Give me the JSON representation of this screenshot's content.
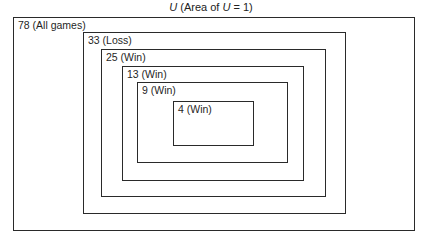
{
  "title": {
    "symbol": "U",
    "prefix": " (Area of ",
    "symbol2": "U",
    "suffix": " = 1)"
  },
  "boxes": [
    {
      "label": "78 (All games)",
      "count": 78,
      "outcome": "All games",
      "left": 13,
      "top": 17,
      "right": 415,
      "bottom": 231
    },
    {
      "label": "33 (Loss)",
      "count": 33,
      "outcome": "Loss",
      "left": 83,
      "top": 32,
      "right": 346,
      "bottom": 214
    },
    {
      "label": "25 (Win)",
      "count": 25,
      "outcome": "Win",
      "left": 101,
      "top": 49,
      "right": 326,
      "bottom": 197
    },
    {
      "label": "13 (Win)",
      "count": 13,
      "outcome": "Win",
      "left": 122,
      "top": 66,
      "right": 304,
      "bottom": 181
    },
    {
      "label": "9 (Win)",
      "count": 9,
      "outcome": "Win",
      "left": 137,
      "top": 82,
      "right": 288,
      "bottom": 163
    },
    {
      "label": "4 (Win)",
      "count": 4,
      "outcome": "Win",
      "left": 173,
      "top": 101,
      "right": 254,
      "bottom": 146
    }
  ]
}
